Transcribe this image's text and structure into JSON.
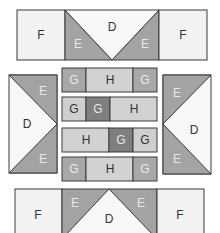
{
  "diagram": {
    "colors": {
      "F": "#f2f2f2",
      "D": "#f8f8f8",
      "E": "#a3a3a3",
      "G_light": "#a8a8a8",
      "G_pale": "#cfcfcf",
      "G_dark": "#7f7f7f",
      "H": "#d2d2d2",
      "stroke": "#3a3a3a"
    },
    "top_row": {
      "left": "F",
      "center_top": "D",
      "center_left": "E",
      "center_right": "E",
      "right": "F"
    },
    "left_block": {
      "top": "E",
      "middle": "D",
      "bottom": "E"
    },
    "right_block": {
      "top": "E",
      "middle": "D",
      "bottom": "E"
    },
    "strips": [
      {
        "cells": [
          "G",
          "H",
          "G"
        ]
      },
      {
        "cells": [
          "G",
          "G",
          "H"
        ]
      },
      {
        "cells": [
          "H",
          "G",
          "G"
        ]
      },
      {
        "cells": [
          "G",
          "H",
          "G"
        ]
      }
    ],
    "bottom_row": {
      "left": "F",
      "center_bottom": "D",
      "center_left": "E",
      "center_right": "E",
      "right": "F"
    }
  }
}
